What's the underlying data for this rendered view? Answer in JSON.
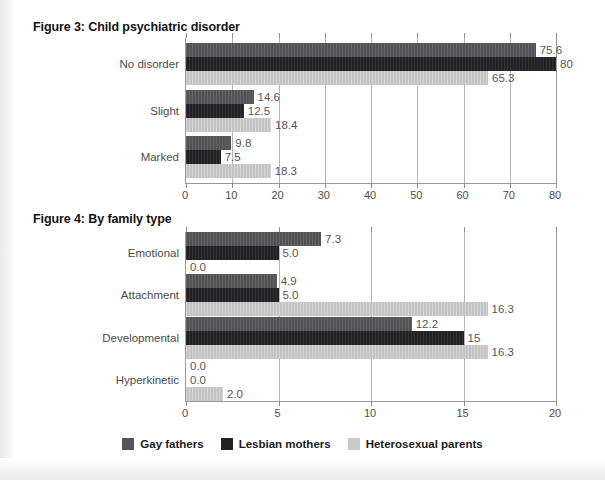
{
  "figures": [
    {
      "title": "Figure 3: Child psychiatric disorder",
      "chart_data": {
        "type": "bar",
        "orientation": "horizontal",
        "title": "Figure 3: Child psychiatric disorder",
        "xlabel": "",
        "ylabel": "",
        "xlim": [
          0,
          80
        ],
        "xticks": [
          0,
          10,
          20,
          30,
          40,
          50,
          60,
          70,
          80
        ],
        "xtick_labels": [
          "0",
          "10",
          "20",
          "30",
          "40",
          "50",
          "60",
          "70",
          "80"
        ],
        "grid": true,
        "legend_position": "bottom",
        "categories": [
          "No disorder",
          "Slight",
          "Marked"
        ],
        "series": [
          {
            "name": "Gay fathers",
            "color": "#56565a",
            "values": [
              75.6,
              14.6,
              9.8
            ],
            "labels": [
              "75.6",
              "14.6",
              "9.8"
            ]
          },
          {
            "name": "Lesbian mothers",
            "color": "#232326",
            "values": [
              80,
              12.5,
              7.5
            ],
            "labels": [
              "80",
              "12.5",
              "7.5"
            ]
          },
          {
            "name": "Heterosexual parents",
            "color": "#c9c9c9",
            "values": [
              65.3,
              18.4,
              18.3
            ],
            "labels": [
              "65.3",
              "18.4",
              "18.3"
            ]
          }
        ]
      }
    },
    {
      "title": "Figure 4: By family type",
      "chart_data": {
        "type": "bar",
        "orientation": "horizontal",
        "title": "Figure 4: By family type",
        "xlabel": "",
        "ylabel": "",
        "xlim": [
          0,
          20
        ],
        "xticks": [
          0,
          5,
          10,
          15,
          20
        ],
        "xtick_labels": [
          "0",
          "5",
          "10",
          "15",
          "20"
        ],
        "grid": true,
        "legend_position": "bottom",
        "categories": [
          "Emotional",
          "Attachment",
          "Developmental",
          "Hyperkinetic"
        ],
        "series": [
          {
            "name": "Gay fathers",
            "color": "#56565a",
            "values": [
              7.3,
              4.9,
              12.2,
              0.0
            ],
            "labels": [
              "7.3",
              "4.9",
              "12.2",
              "0.0"
            ]
          },
          {
            "name": "Lesbian mothers",
            "color": "#232326",
            "values": [
              5.0,
              5.0,
              15,
              0.0
            ],
            "labels": [
              "5.0",
              "5.0",
              "15",
              "0.0"
            ]
          },
          {
            "name": "Heterosexual parents",
            "color": "#c9c9c9",
            "values": [
              0.0,
              16.3,
              16.3,
              2.0
            ],
            "labels": [
              "0.0",
              "16.3",
              "16.3",
              "2.0"
            ]
          }
        ]
      }
    }
  ],
  "legend": {
    "items": [
      {
        "label": "Gay fathers",
        "color": "#56565a"
      },
      {
        "label": "Lesbian mothers",
        "color": "#232326"
      },
      {
        "label": "Heterosexual parents",
        "color": "#c9c9c9"
      }
    ]
  }
}
